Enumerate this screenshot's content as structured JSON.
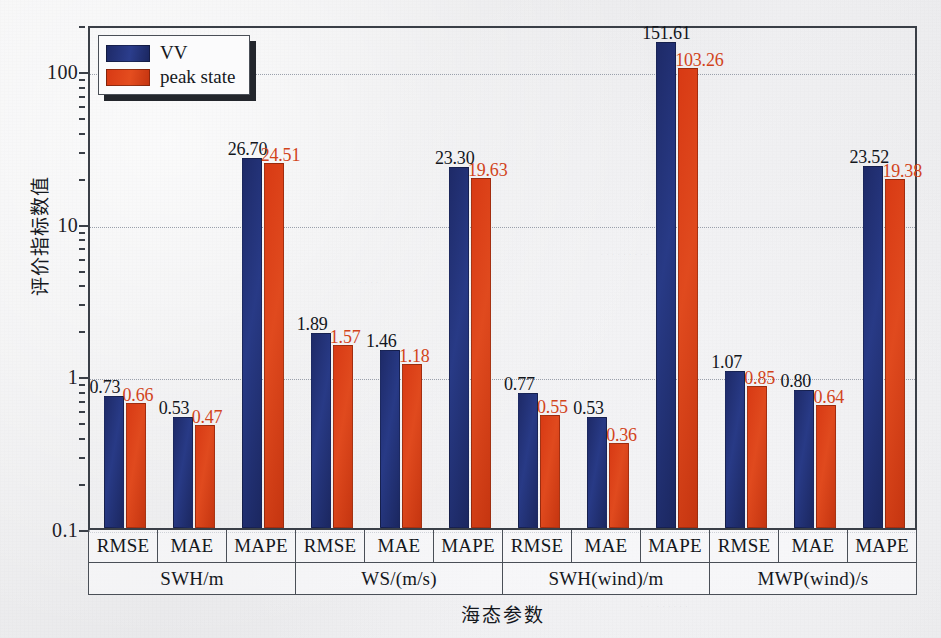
{
  "chart_data": {
    "type": "bar",
    "title": "",
    "xlabel": "海态参数",
    "ylabel": "评价指标数值",
    "yscale": "log",
    "ylim": [
      0.1,
      200
    ],
    "ytick_labels": [
      "0.1",
      "1",
      "10",
      "100"
    ],
    "ytick_values": [
      0.1,
      1,
      10,
      100
    ],
    "grid": true,
    "legend_position": "top-left",
    "groups": [
      "SWH/m",
      "WS/(m/s)",
      "SWH(wind)/m",
      "MWP(wind)/s"
    ],
    "metrics": [
      "RMSE",
      "MAE",
      "MAPE"
    ],
    "categories": [
      "RMSE",
      "MAE",
      "MAPE",
      "RMSE",
      "MAE",
      "MAPE",
      "RMSE",
      "MAE",
      "MAPE",
      "RMSE",
      "MAE",
      "MAPE"
    ],
    "series": [
      {
        "name": "VV",
        "color": "#233478",
        "values": [
          0.73,
          0.53,
          26.7,
          1.89,
          1.46,
          23.3,
          0.77,
          0.53,
          151.61,
          1.07,
          0.8,
          23.52
        ],
        "labels": [
          "0.73",
          "0.53",
          "26.70",
          "1.89",
          "1.46",
          "23.30",
          "0.77",
          "0.53",
          "151.61",
          "1.07",
          "0.80",
          "23.52"
        ]
      },
      {
        "name": "peak state",
        "color": "#dc4318",
        "values": [
          0.66,
          0.47,
          24.51,
          1.57,
          1.18,
          19.63,
          0.55,
          0.36,
          103.26,
          0.85,
          0.64,
          19.38
        ],
        "labels": [
          "0.66",
          "0.47",
          "24.51",
          "1.57",
          "1.18",
          "19.63",
          "0.55",
          "0.36",
          "103.26",
          "0.85",
          "0.64",
          "19.38"
        ]
      }
    ]
  },
  "legend": {
    "items": [
      {
        "label": "VV",
        "swatch": "#233478"
      },
      {
        "label": "peak state",
        "swatch": "#dc4318"
      }
    ]
  },
  "axes": {
    "y_title": "评价指标数值",
    "x_title": "海态参数",
    "y_ticks": [
      "100",
      "10",
      "1",
      "0.1"
    ]
  }
}
